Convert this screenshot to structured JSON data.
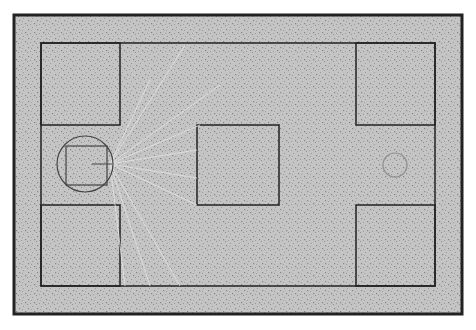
{
  "scene": {
    "title": "Top-down arena with agent vision rays",
    "background": "#ffffff",
    "floor_color": "#c4c4c4",
    "speckle_color": "#8a8a8a",
    "wall_color": "#222222",
    "ray_color": "#e2e2e2",
    "outer_border": {
      "x": 14,
      "y": 15,
      "w": 448,
      "h": 299
    },
    "inner_boundary": {
      "x": 41,
      "y": 43,
      "w": 394,
      "h": 243
    },
    "obstacles": [
      {
        "name": "top-left-block",
        "x": 41,
        "y": 43,
        "w": 79,
        "h": 82
      },
      {
        "name": "bottom-left-block",
        "x": 41,
        "y": 205,
        "w": 79,
        "h": 81
      },
      {
        "name": "center-block",
        "x": 197,
        "y": 125,
        "w": 82,
        "h": 80
      },
      {
        "name": "top-right-block",
        "x": 356,
        "y": 43,
        "w": 79,
        "h": 82
      },
      {
        "name": "bottom-right-block",
        "x": 356,
        "y": 205,
        "w": 79,
        "h": 81
      }
    ],
    "agent": {
      "cx": 85,
      "cy": 164,
      "r": 28,
      "body": {
        "x": 66,
        "y": 146,
        "w": 41,
        "h": 39
      },
      "heading": {
        "x1": 92,
        "y1": 164,
        "x2": 112,
        "y2": 164
      }
    },
    "target": {
      "cx": 395,
      "cy": 165,
      "r": 12
    },
    "ray_origin": {
      "x": 110,
      "y": 164
    },
    "rays": [
      {
        "x": 185,
        "y": 45
      },
      {
        "x": 220,
        "y": 85
      },
      {
        "x": 150,
        "y": 80
      },
      {
        "x": 200,
        "y": 125
      },
      {
        "x": 197,
        "y": 150
      },
      {
        "x": 197,
        "y": 178
      },
      {
        "x": 197,
        "y": 205
      },
      {
        "x": 180,
        "y": 286
      },
      {
        "x": 150,
        "y": 286
      },
      {
        "x": 125,
        "y": 286
      }
    ]
  }
}
